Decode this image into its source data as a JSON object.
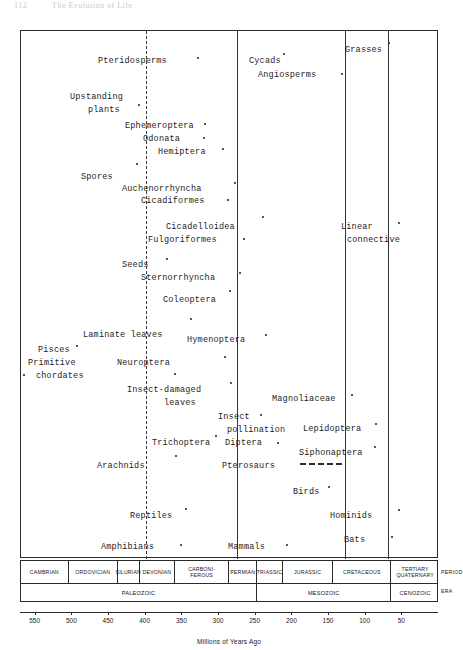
{
  "page_header": {
    "number": "112",
    "title": "The Evolution of Life"
  },
  "chart_data": {
    "type": "scatter",
    "xlabel": "Millions of Years Ago",
    "xlim": [
      570,
      0
    ],
    "x_ticks": [
      550,
      500,
      450,
      400,
      350,
      300,
      250,
      200,
      150,
      100,
      50
    ],
    "grid": false,
    "legend": "none",
    "row_tags": {
      "period": "PERIOD",
      "era": "ERA"
    },
    "periods": [
      {
        "name": "CAMBRIAN",
        "start": 570,
        "end": 505
      },
      {
        "name": "ORDOVICIAN",
        "start": 505,
        "end": 438
      },
      {
        "name": "SILURIAN",
        "start": 438,
        "end": 408
      },
      {
        "name": "DEVONIAN",
        "start": 408,
        "end": 360
      },
      {
        "name": "CARBONI-\nFEROUS",
        "start": 360,
        "end": 286
      },
      {
        "name": "PERMIAN",
        "start": 286,
        "end": 248
      },
      {
        "name": "TRIASSIC",
        "start": 248,
        "end": 213
      },
      {
        "name": "JURASSIC",
        "start": 213,
        "end": 144
      },
      {
        "name": "CRETACEOUS",
        "start": 144,
        "end": 65
      },
      {
        "name": "TERTIARY\nQUATERNARY",
        "start": 65,
        "end": 0
      }
    ],
    "eras": [
      {
        "name": "PALEOZOIC",
        "start": 570,
        "end": 248
      },
      {
        "name": "MESOZOIC",
        "start": 248,
        "end": 65
      },
      {
        "name": "CENOZOIC",
        "start": 65,
        "end": 0
      }
    ],
    "reference_lines": [
      {
        "name": "devonian-dashed-line",
        "x_ma": 400,
        "style": "dashed"
      },
      {
        "name": "permian-line",
        "x_ma": 275,
        "style": "solid"
      },
      {
        "name": "cretaceous-line",
        "x_ma": 128,
        "style": "solid"
      },
      {
        "name": "tertiary-line",
        "x_ma": 70,
        "style": "solid"
      }
    ],
    "events": [
      {
        "label": "Pteridosperms",
        "lx": 98,
        "ly": 56,
        "align": "ctr",
        "dot_x": 197,
        "dot_y": 57
      },
      {
        "label": "Cycads",
        "lx": 249,
        "ly": 56,
        "align": "l",
        "dot_x": 283,
        "dot_y": 53
      },
      {
        "label": "Grasses",
        "lx": 345,
        "ly": 45,
        "align": "l",
        "dot_x": 388,
        "dot_y": 42
      },
      {
        "label": "Angiosperms",
        "lx": 258,
        "ly": 70,
        "align": "l",
        "dot_x": 341,
        "dot_y": 73
      },
      {
        "label": "Upstanding",
        "lx": 70,
        "ly": 92,
        "align": "l",
        "dot_x": null,
        "dot_y": null
      },
      {
        "label": "plants",
        "lx": 88,
        "ly": 105,
        "align": "l",
        "dot_x": 138,
        "dot_y": 104
      },
      {
        "label": "Ephemeroptera",
        "lx": 125,
        "ly": 121,
        "align": "l",
        "dot_x": 204,
        "dot_y": 123
      },
      {
        "label": "Odonata",
        "lx": 143,
        "ly": 134,
        "align": "l",
        "dot_x": 203,
        "dot_y": 137
      },
      {
        "label": "Hemiptera",
        "lx": 158,
        "ly": 147,
        "align": "l",
        "dot_x": 222,
        "dot_y": 148
      },
      {
        "label": "Spores",
        "lx": 81,
        "ly": 172,
        "align": "l",
        "dot_x": 136,
        "dot_y": 163
      },
      {
        "label": "Auchenorrhyncha",
        "lx": 122,
        "ly": 184,
        "align": "l",
        "dot_x": 234,
        "dot_y": 182
      },
      {
        "label": "Cicadiformes",
        "lx": 141,
        "ly": 196,
        "align": "l",
        "dot_x": 227,
        "dot_y": 199
      },
      {
        "label": "Cicadelloidea",
        "lx": 166,
        "ly": 222,
        "align": "l",
        "dot_x": 262,
        "dot_y": 216
      },
      {
        "label": "Fulgoriformes",
        "lx": 148,
        "ly": 235,
        "align": "l",
        "dot_x": 243,
        "dot_y": 238
      },
      {
        "label": "Linear",
        "lx": 341,
        "ly": 222,
        "align": "l",
        "dot_x": 398,
        "dot_y": 222
      },
      {
        "label": "connective",
        "lx": 347,
        "ly": 235,
        "align": "l",
        "dot_x": null,
        "dot_y": null
      },
      {
        "label": "Seeds",
        "lx": 122,
        "ly": 260,
        "align": "l",
        "dot_x": 166,
        "dot_y": 258
      },
      {
        "label": "Sternorrhyncha",
        "lx": 141,
        "ly": 273,
        "align": "l",
        "dot_x": 239,
        "dot_y": 272
      },
      {
        "label": "Coleoptera",
        "lx": 163,
        "ly": 295,
        "align": "l",
        "dot_x": 229,
        "dot_y": 290
      },
      {
        "label": "Laminate leaves",
        "lx": 83,
        "ly": 330,
        "align": "l",
        "dot_x": 190,
        "dot_y": 318
      },
      {
        "label": "Hymenoptera",
        "lx": 187,
        "ly": 335,
        "align": "l",
        "dot_x": 265,
        "dot_y": 334
      },
      {
        "label": "Pisces",
        "lx": 38,
        "ly": 345,
        "align": "l",
        "dot_x": 76,
        "dot_y": 345
      },
      {
        "label": "Primitive",
        "lx": 28,
        "ly": 358,
        "align": "l",
        "dot_x": null,
        "dot_y": null
      },
      {
        "label": "chordates",
        "lx": 36,
        "ly": 371,
        "align": "l",
        "dot_x": 23,
        "dot_y": 374
      },
      {
        "label": "Neuroptera",
        "lx": 117,
        "ly": 358,
        "align": "l",
        "dot_x": 224,
        "dot_y": 356
      },
      {
        "label": "Insect-damaged",
        "lx": 127,
        "ly": 385,
        "align": "l",
        "dot_x": 230,
        "dot_y": 382
      },
      {
        "label": "leaves",
        "lx": 164,
        "ly": 398,
        "align": "l",
        "dot_x": 174,
        "dot_y": 373
      },
      {
        "label": "Magnoliaceae",
        "lx": 272,
        "ly": 394,
        "align": "l",
        "dot_x": 351,
        "dot_y": 394
      },
      {
        "label": "Insect",
        "lx": 218,
        "ly": 412,
        "align": "l",
        "dot_x": 260,
        "dot_y": 414
      },
      {
        "label": "pollination",
        "lx": 227,
        "ly": 425,
        "align": "l",
        "dot_x": null,
        "dot_y": null
      },
      {
        "label": "Lepidoptera",
        "lx": 303,
        "ly": 424,
        "align": "l",
        "dot_x": 375,
        "dot_y": 423
      },
      {
        "label": "Trichoptera",
        "lx": 152,
        "ly": 438,
        "align": "l",
        "dot_x": 215,
        "dot_y": 435
      },
      {
        "label": "Diptera",
        "lx": 225,
        "ly": 438,
        "align": "l",
        "dot_x": 277,
        "dot_y": 442
      },
      {
        "label": "Siphonaptera",
        "lx": 299,
        "ly": 448,
        "align": "l",
        "dot_x": 374,
        "dot_y": 446
      },
      {
        "label": "Arachnids",
        "lx": 97,
        "ly": 461,
        "align": "l",
        "dot_x": 175,
        "dot_y": 455
      },
      {
        "label": "Pterosaurs",
        "lx": 222,
        "ly": 461,
        "align": "l",
        "dot_x": null,
        "dot_y": null
      },
      {
        "label": "Birds",
        "lx": 293,
        "ly": 487,
        "align": "l",
        "dot_x": 328,
        "dot_y": 486
      },
      {
        "label": "Reptiles",
        "lx": 130,
        "ly": 511,
        "align": "l",
        "dot_x": 185,
        "dot_y": 508
      },
      {
        "label": "Hominids",
        "lx": 330,
        "ly": 511,
        "align": "l",
        "dot_x": 398,
        "dot_y": 509
      },
      {
        "label": "Amphibians",
        "lx": 101,
        "ly": 542,
        "align": "l",
        "dot_x": 180,
        "dot_y": 544
      },
      {
        "label": "Mammals",
        "lx": 228,
        "ly": 542,
        "align": "l",
        "dot_x": 286,
        "dot_y": 544
      },
      {
        "label": "Bats",
        "lx": 344,
        "ly": 535,
        "align": "l",
        "dot_x": 391,
        "dot_y": 536
      }
    ],
    "dashed_connector": {
      "name": "siphonaptera-connector",
      "x": 300,
      "y": 463,
      "width": 42
    }
  }
}
